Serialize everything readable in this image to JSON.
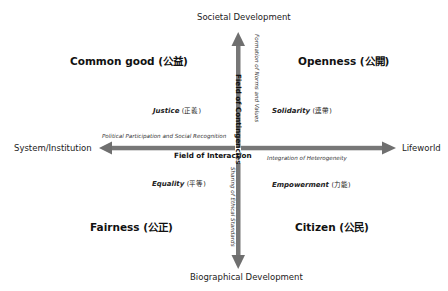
{
  "poles": {
    "top": "Societal Development",
    "bottom": "Biographical Development",
    "left": "System/Institution",
    "right": "Lifeworld"
  },
  "quadrants": {
    "top_left": "Common good (公益)",
    "top_right": "Openness (公開)",
    "bottom_left": "Fairness (公正)",
    "bottom_right": "Citizen (公民)"
  },
  "values": {
    "top_left": {
      "en": "Justice",
      "zh": "(正義)"
    },
    "top_right": {
      "en": "Solidarity",
      "zh": "(連帶)"
    },
    "bottom_left": {
      "en": "Equality",
      "zh": "(平等)"
    },
    "bottom_right": {
      "en": "Empowerment",
      "zh": "(力能)"
    }
  },
  "processes": {
    "left": "Political Participation and Social Recognition",
    "right": "Integration of Heterogeneity",
    "up": "Formation of Norms and Values",
    "down": "Sharing of Ethical Standards"
  },
  "fields": {
    "vertical": "Field of Contingencies",
    "center": "Field of Interaction"
  },
  "colors": {
    "arrow": "#777777",
    "text": "#1a1a1a"
  }
}
